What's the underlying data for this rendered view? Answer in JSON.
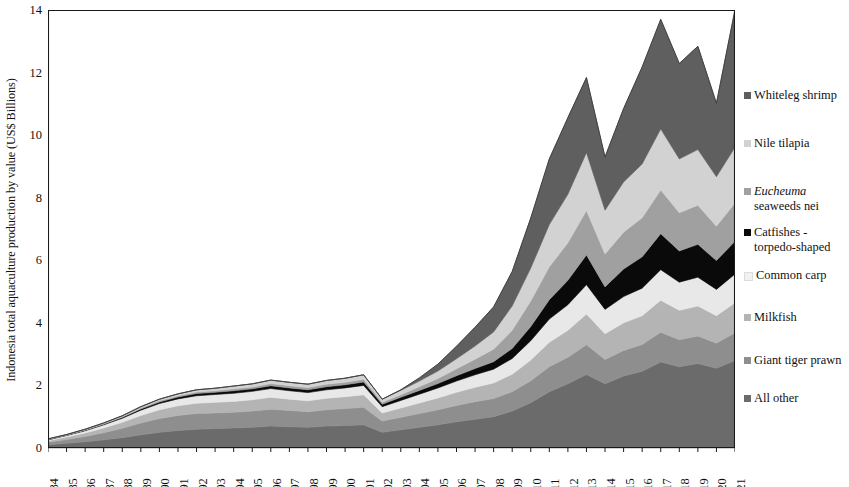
{
  "chart_data": {
    "type": "area",
    "stacked": true,
    "title": "",
    "xlabel": "",
    "ylabel": "Indonesia total aquaculture production by value (US$ Billions)",
    "ylim": [
      0,
      14
    ],
    "yticks": [
      0,
      2,
      4,
      6,
      8,
      10,
      12,
      14
    ],
    "grid": false,
    "legend_position": "right",
    "categories": [
      "1984",
      "1985",
      "1986",
      "1987",
      "1988",
      "1989",
      "1990",
      "1991",
      "1992",
      "1993",
      "1994",
      "1995",
      "1996",
      "1997",
      "1998",
      "1999",
      "2000",
      "2001",
      "2002",
      "2003",
      "2004",
      "2005",
      "2006",
      "2007",
      "2008",
      "2009",
      "2010",
      "2011",
      "2012",
      "2013",
      "2014",
      "2015",
      "2016",
      "2017",
      "2018",
      "2019",
      "2020",
      "2021"
    ],
    "stack_order_bottom_to_top": [
      "All other",
      "Giant tiger prawn",
      "Milkfish",
      "Common carp",
      "Catfishes - torpedo-shaped",
      "Eucheuma seaweeds nei",
      "Nile tilapia",
      "Whiteleg shrimp"
    ],
    "series": [
      {
        "name": "All other",
        "color": "#6b6b6b",
        "values": [
          0.1,
          0.15,
          0.2,
          0.26,
          0.33,
          0.42,
          0.5,
          0.56,
          0.6,
          0.62,
          0.64,
          0.66,
          0.7,
          0.68,
          0.66,
          0.7,
          0.72,
          0.74,
          0.5,
          0.58,
          0.66,
          0.74,
          0.84,
          0.92,
          1.0,
          1.18,
          1.45,
          1.8,
          2.05,
          2.35,
          2.05,
          2.3,
          2.45,
          2.75,
          2.6,
          2.7,
          2.55,
          2.8
        ]
      },
      {
        "name": "Giant tiger prawn",
        "color": "#8e8e8e",
        "values": [
          0.08,
          0.12,
          0.17,
          0.23,
          0.3,
          0.38,
          0.44,
          0.48,
          0.5,
          0.5,
          0.5,
          0.52,
          0.54,
          0.52,
          0.5,
          0.52,
          0.54,
          0.56,
          0.36,
          0.4,
          0.44,
          0.48,
          0.52,
          0.56,
          0.58,
          0.62,
          0.7,
          0.8,
          0.85,
          0.95,
          0.78,
          0.82,
          0.86,
          0.95,
          0.86,
          0.88,
          0.8,
          0.88
        ]
      },
      {
        "name": "Milkfish",
        "color": "#b4b4b4",
        "values": [
          0.05,
          0.08,
          0.11,
          0.15,
          0.19,
          0.24,
          0.28,
          0.31,
          0.33,
          0.34,
          0.35,
          0.36,
          0.38,
          0.36,
          0.35,
          0.37,
          0.38,
          0.4,
          0.26,
          0.3,
          0.34,
          0.38,
          0.42,
          0.46,
          0.5,
          0.56,
          0.66,
          0.78,
          0.86,
          0.98,
          0.82,
          0.88,
          0.92,
          1.02,
          0.94,
          0.96,
          0.88,
          0.96
        ]
      },
      {
        "name": "Common carp",
        "color": "#e8e8e8",
        "values": [
          0.03,
          0.05,
          0.07,
          0.1,
          0.13,
          0.17,
          0.2,
          0.22,
          0.24,
          0.25,
          0.26,
          0.27,
          0.28,
          0.27,
          0.26,
          0.27,
          0.28,
          0.3,
          0.2,
          0.24,
          0.28,
          0.32,
          0.36,
          0.4,
          0.44,
          0.5,
          0.62,
          0.74,
          0.82,
          0.94,
          0.78,
          0.84,
          0.88,
          0.98,
          0.9,
          0.92,
          0.84,
          0.92
        ]
      },
      {
        "name": "Catfishes - torpedo-shaped",
        "color": "#0a0a0a",
        "values": [
          0.01,
          0.01,
          0.02,
          0.02,
          0.03,
          0.04,
          0.05,
          0.06,
          0.07,
          0.07,
          0.08,
          0.08,
          0.09,
          0.09,
          0.09,
          0.1,
          0.1,
          0.11,
          0.08,
          0.1,
          0.12,
          0.14,
          0.17,
          0.2,
          0.24,
          0.32,
          0.45,
          0.62,
          0.78,
          0.95,
          0.72,
          0.88,
          1.0,
          1.15,
          1.0,
          1.05,
          0.92,
          1.05
        ]
      },
      {
        "name": "Eucheuma seaweeds nei",
        "color": "#a0a0a0",
        "values": [
          0.01,
          0.01,
          0.01,
          0.02,
          0.02,
          0.03,
          0.04,
          0.04,
          0.05,
          0.05,
          0.06,
          0.06,
          0.07,
          0.07,
          0.07,
          0.08,
          0.08,
          0.09,
          0.06,
          0.08,
          0.12,
          0.16,
          0.22,
          0.3,
          0.4,
          0.58,
          0.82,
          1.05,
          1.2,
          1.42,
          1.05,
          1.18,
          1.25,
          1.4,
          1.22,
          1.25,
          1.1,
          1.22
        ]
      },
      {
        "name": "Nile tilapia",
        "color": "#d2d2d2",
        "values": [
          0.01,
          0.01,
          0.02,
          0.02,
          0.03,
          0.04,
          0.05,
          0.06,
          0.07,
          0.08,
          0.09,
          0.1,
          0.11,
          0.11,
          0.11,
          0.12,
          0.13,
          0.14,
          0.1,
          0.14,
          0.18,
          0.24,
          0.32,
          0.42,
          0.55,
          0.78,
          1.05,
          1.35,
          1.55,
          1.85,
          1.4,
          1.6,
          1.72,
          1.95,
          1.72,
          1.78,
          1.58,
          1.78
        ]
      },
      {
        "name": "Whiteleg shrimp",
        "color": "#5f5f5f",
        "values": [
          0.0,
          0.0,
          0.0,
          0.0,
          0.0,
          0.0,
          0.0,
          0.0,
          0.0,
          0.0,
          0.0,
          0.0,
          0.0,
          0.0,
          0.0,
          0.0,
          0.0,
          0.0,
          0.0,
          0.02,
          0.1,
          0.22,
          0.4,
          0.6,
          0.8,
          1.1,
          1.6,
          2.1,
          2.45,
          2.4,
          1.7,
          2.35,
          3.1,
          3.5,
          3.05,
          3.3,
          2.35,
          4.4
        ]
      }
    ],
    "totals": [
      0.29,
      0.43,
      0.6,
      0.8,
      1.03,
      1.32,
      1.56,
      1.73,
      1.86,
      1.91,
      1.98,
      2.05,
      2.17,
      2.1,
      2.04,
      2.16,
      2.23,
      2.34,
      1.56,
      1.86,
      2.24,
      2.68,
      3.25,
      3.86,
      4.51,
      5.64,
      7.35,
      9.24,
      10.56,
      11.84,
      9.3,
      10.85,
      12.18,
      13.7,
      12.29,
      12.64,
      11.02,
      14.01
    ]
  },
  "axis": {
    "ylabel": "Indonesia total aquaculture production by value (US$ Billions)",
    "ytick_labels": [
      "14",
      "12",
      "10",
      "8",
      "6",
      "4",
      "2",
      "0"
    ],
    "xtick_labels": [
      "1984",
      "1985",
      "1986",
      "1987",
      "1988",
      "1989",
      "1990",
      "1991",
      "1992",
      "1993",
      "1994",
      "1995",
      "1996",
      "1997",
      "1998",
      "1999",
      "2000",
      "2001",
      "2002",
      "2003",
      "2004",
      "2005",
      "2006",
      "2007",
      "2008",
      "2009",
      "2010",
      "2011",
      "2012",
      "2013",
      "2014",
      "2015",
      "2016",
      "2017",
      "2018",
      "2019",
      "2020",
      "2021"
    ]
  },
  "legend": {
    "items": [
      {
        "label": "Whiteleg shrimp",
        "color": "#5f5f5f",
        "italic_prefix": ""
      },
      {
        "label": "Nile tilapia",
        "color": "#d2d2d2",
        "italic_prefix": ""
      },
      {
        "label": "seaweeds nei",
        "color": "#a0a0a0",
        "italic_prefix": "Eucheuma"
      },
      {
        "label": "Catfishes - torpedo-shaped",
        "color": "#0a0a0a",
        "italic_prefix": ""
      },
      {
        "label": "Common carp",
        "color": "#f2f2f2",
        "italic_prefix": ""
      },
      {
        "label": "Milkfish",
        "color": "#b4b4b4",
        "italic_prefix": ""
      },
      {
        "label": "Giant tiger prawn",
        "color": "#8e8e8e",
        "italic_prefix": ""
      },
      {
        "label": "All other",
        "color": "#6b6b6b",
        "italic_prefix": ""
      }
    ]
  }
}
